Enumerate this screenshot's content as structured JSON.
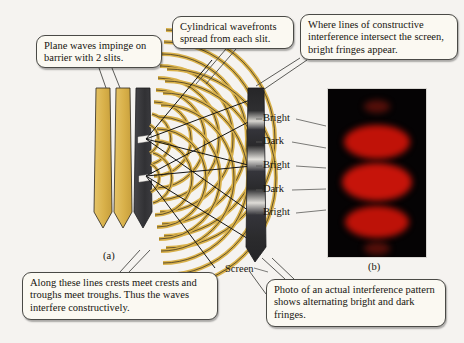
{
  "figure": {
    "background_color": "#f5f3f0"
  },
  "callouts": [
    {
      "id": "plane-waves",
      "text": "Plane waves impinge on barrier with 2 slits."
    },
    {
      "id": "cylindrical-wavefronts",
      "text": "Cylindrical wavefronts spread from each slit."
    },
    {
      "id": "bright-fringes",
      "text": "Where lines of constructive interference intersect the screen, bright fringes appear."
    },
    {
      "id": "constructive-lines",
      "text": "Along these lines crests meet crests and troughs meet troughs. Thus the waves interfere constructively."
    },
    {
      "id": "photo-description",
      "text": "Photo of an actual interference pattern shows alternating bright and dark fringes."
    }
  ],
  "fringe_labels": [
    {
      "text": "Bright",
      "y": 119
    },
    {
      "text": "Dark",
      "y": 142
    },
    {
      "text": "Bright",
      "y": 166
    },
    {
      "text": "Dark",
      "y": 190
    },
    {
      "text": "Bright",
      "y": 213
    }
  ],
  "part_labels": {
    "a": "(a)",
    "b": "(b)",
    "screen": "Screen"
  },
  "colors": {
    "wavefront_yellow": "#d9b14a",
    "wavefront_outline": "#2b2720",
    "barrier_dark": "#3a3a3c",
    "screen_dark": "#2d2d2f",
    "fringe_red": "#c01208",
    "photo_black": "#050304",
    "callout_fill": "#fbf9f2",
    "callout_border": "#4a4a46",
    "ray_black": "#141414"
  },
  "photo": {
    "alt": "Photograph of real double-slit interference pattern: red fringes on black",
    "fringes": [
      {
        "center_y": 18,
        "width": 26,
        "height": 13,
        "intensity": 0.3
      },
      {
        "center_y": 53,
        "width": 66,
        "height": 34,
        "intensity": 1.0
      },
      {
        "center_y": 93,
        "width": 70,
        "height": 38,
        "intensity": 1.0
      },
      {
        "center_y": 133,
        "width": 64,
        "height": 32,
        "intensity": 0.95
      },
      {
        "center_y": 160,
        "width": 26,
        "height": 13,
        "intensity": 0.32
      }
    ]
  }
}
